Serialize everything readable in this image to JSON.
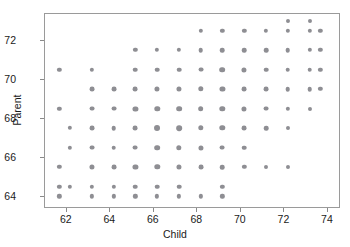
{
  "chart_data": {
    "type": "scatter",
    "title": "",
    "xlabel": "Child",
    "ylabel": "Parent",
    "xlim": [
      61.0,
      74.6
    ],
    "ylim": [
      63.4,
      73.4
    ],
    "grid": false,
    "legend": "none",
    "xticks": [
      62,
      64,
      66,
      68,
      70,
      72,
      74
    ],
    "yticks": [
      64,
      66,
      68,
      70,
      72
    ],
    "xtick_labels": [
      "62",
      "64",
      "66",
      "68",
      "70",
      "72",
      "74"
    ],
    "ytick_labels": [
      "64",
      "66",
      "68",
      "70",
      "72"
    ],
    "marker_color": "#8e8e93",
    "frame_color": "#9a9a9a",
    "points": [
      {
        "x": 61.7,
        "y": 70.5,
        "size": 3.2
      },
      {
        "x": 61.7,
        "y": 68.5,
        "size": 3.2
      },
      {
        "x": 61.7,
        "y": 65.5,
        "size": 3.2
      },
      {
        "x": 61.7,
        "y": 64.5,
        "size": 3.2
      },
      {
        "x": 61.7,
        "y": 64.0,
        "size": 3.2
      },
      {
        "x": 62.2,
        "y": 67.5,
        "size": 3.2
      },
      {
        "x": 62.2,
        "y": 66.5,
        "size": 3.2
      },
      {
        "x": 62.2,
        "y": 64.5,
        "size": 3.2
      },
      {
        "x": 63.2,
        "y": 70.5,
        "size": 3.2
      },
      {
        "x": 63.2,
        "y": 69.5,
        "size": 3.6
      },
      {
        "x": 63.2,
        "y": 68.5,
        "size": 3.6
      },
      {
        "x": 63.2,
        "y": 67.5,
        "size": 3.6
      },
      {
        "x": 63.2,
        "y": 66.5,
        "size": 3.6
      },
      {
        "x": 63.2,
        "y": 65.5,
        "size": 3.8
      },
      {
        "x": 63.2,
        "y": 64.5,
        "size": 3.2
      },
      {
        "x": 63.2,
        "y": 64.0,
        "size": 3.2
      },
      {
        "x": 64.2,
        "y": 69.5,
        "size": 3.6
      },
      {
        "x": 64.2,
        "y": 68.5,
        "size": 3.6
      },
      {
        "x": 64.2,
        "y": 67.5,
        "size": 3.4
      },
      {
        "x": 64.2,
        "y": 66.5,
        "size": 3.4
      },
      {
        "x": 64.2,
        "y": 65.5,
        "size": 3.6
      },
      {
        "x": 64.2,
        "y": 64.5,
        "size": 3.2
      },
      {
        "x": 64.2,
        "y": 64.0,
        "size": 3.2
      },
      {
        "x": 65.2,
        "y": 71.5,
        "size": 3.2
      },
      {
        "x": 65.2,
        "y": 70.5,
        "size": 3.4
      },
      {
        "x": 65.2,
        "y": 69.5,
        "size": 3.6
      },
      {
        "x": 65.2,
        "y": 68.5,
        "size": 3.8
      },
      {
        "x": 65.2,
        "y": 67.5,
        "size": 3.6
      },
      {
        "x": 65.2,
        "y": 66.5,
        "size": 3.6
      },
      {
        "x": 65.2,
        "y": 65.5,
        "size": 3.8
      },
      {
        "x": 65.2,
        "y": 64.5,
        "size": 3.4
      },
      {
        "x": 65.2,
        "y": 64.0,
        "size": 3.2
      },
      {
        "x": 66.2,
        "y": 71.5,
        "size": 3.2
      },
      {
        "x": 66.2,
        "y": 70.5,
        "size": 3.4
      },
      {
        "x": 66.2,
        "y": 69.5,
        "size": 3.8
      },
      {
        "x": 66.2,
        "y": 68.5,
        "size": 4.0
      },
      {
        "x": 66.2,
        "y": 67.5,
        "size": 4.4
      },
      {
        "x": 66.2,
        "y": 66.5,
        "size": 4.2
      },
      {
        "x": 66.2,
        "y": 65.5,
        "size": 4.0
      },
      {
        "x": 66.2,
        "y": 64.5,
        "size": 3.4
      },
      {
        "x": 66.2,
        "y": 64.0,
        "size": 3.2
      },
      {
        "x": 67.2,
        "y": 71.5,
        "size": 3.2
      },
      {
        "x": 67.2,
        "y": 70.5,
        "size": 3.4
      },
      {
        "x": 67.2,
        "y": 69.5,
        "size": 3.8
      },
      {
        "x": 67.2,
        "y": 68.5,
        "size": 4.2
      },
      {
        "x": 67.2,
        "y": 67.5,
        "size": 4.2
      },
      {
        "x": 67.2,
        "y": 66.5,
        "size": 4.0
      },
      {
        "x": 67.2,
        "y": 65.5,
        "size": 3.8
      },
      {
        "x": 67.2,
        "y": 64.5,
        "size": 3.4
      },
      {
        "x": 67.2,
        "y": 64.0,
        "size": 3.2
      },
      {
        "x": 68.2,
        "y": 72.5,
        "size": 3.2
      },
      {
        "x": 68.2,
        "y": 71.5,
        "size": 3.4
      },
      {
        "x": 68.2,
        "y": 70.5,
        "size": 3.6
      },
      {
        "x": 68.2,
        "y": 69.5,
        "size": 4.0
      },
      {
        "x": 68.2,
        "y": 68.5,
        "size": 4.2
      },
      {
        "x": 68.2,
        "y": 67.5,
        "size": 4.0
      },
      {
        "x": 68.2,
        "y": 66.5,
        "size": 3.8
      },
      {
        "x": 68.2,
        "y": 65.5,
        "size": 3.6
      },
      {
        "x": 68.2,
        "y": 64.0,
        "size": 3.2
      },
      {
        "x": 69.2,
        "y": 72.5,
        "size": 3.2
      },
      {
        "x": 69.2,
        "y": 71.5,
        "size": 3.4
      },
      {
        "x": 69.2,
        "y": 70.5,
        "size": 4.2
      },
      {
        "x": 69.2,
        "y": 69.5,
        "size": 3.8
      },
      {
        "x": 69.2,
        "y": 68.5,
        "size": 4.0
      },
      {
        "x": 69.2,
        "y": 67.5,
        "size": 4.0
      },
      {
        "x": 69.2,
        "y": 66.5,
        "size": 3.6
      },
      {
        "x": 69.2,
        "y": 65.5,
        "size": 3.4
      },
      {
        "x": 69.2,
        "y": 64.5,
        "size": 3.2
      },
      {
        "x": 69.2,
        "y": 64.0,
        "size": 3.2
      },
      {
        "x": 70.2,
        "y": 72.5,
        "size": 3.2
      },
      {
        "x": 70.2,
        "y": 71.5,
        "size": 3.4
      },
      {
        "x": 70.2,
        "y": 70.5,
        "size": 3.8
      },
      {
        "x": 70.2,
        "y": 69.5,
        "size": 3.6
      },
      {
        "x": 70.2,
        "y": 68.5,
        "size": 3.8
      },
      {
        "x": 70.2,
        "y": 67.5,
        "size": 3.6
      },
      {
        "x": 70.2,
        "y": 66.5,
        "size": 3.4
      },
      {
        "x": 70.2,
        "y": 65.5,
        "size": 3.2
      },
      {
        "x": 71.2,
        "y": 72.5,
        "size": 3.2
      },
      {
        "x": 71.2,
        "y": 71.5,
        "size": 3.4
      },
      {
        "x": 71.2,
        "y": 70.5,
        "size": 3.4
      },
      {
        "x": 71.2,
        "y": 69.5,
        "size": 3.6
      },
      {
        "x": 71.2,
        "y": 68.5,
        "size": 3.6
      },
      {
        "x": 71.2,
        "y": 67.5,
        "size": 3.4
      },
      {
        "x": 71.2,
        "y": 65.5,
        "size": 3.0
      },
      {
        "x": 72.2,
        "y": 73.0,
        "size": 3.0
      },
      {
        "x": 72.2,
        "y": 72.5,
        "size": 3.2
      },
      {
        "x": 72.2,
        "y": 71.5,
        "size": 3.4
      },
      {
        "x": 72.2,
        "y": 70.5,
        "size": 3.4
      },
      {
        "x": 72.2,
        "y": 69.5,
        "size": 3.4
      },
      {
        "x": 72.2,
        "y": 68.5,
        "size": 3.2
      },
      {
        "x": 72.2,
        "y": 67.5,
        "size": 3.0
      },
      {
        "x": 72.2,
        "y": 65.5,
        "size": 3.0
      },
      {
        "x": 73.2,
        "y": 73.0,
        "size": 3.0
      },
      {
        "x": 73.2,
        "y": 72.5,
        "size": 3.2
      },
      {
        "x": 73.2,
        "y": 71.5,
        "size": 3.2
      },
      {
        "x": 73.2,
        "y": 70.5,
        "size": 3.4
      },
      {
        "x": 73.2,
        "y": 69.5,
        "size": 3.4
      },
      {
        "x": 73.2,
        "y": 68.5,
        "size": 3.0
      },
      {
        "x": 73.7,
        "y": 72.5,
        "size": 3.2
      },
      {
        "x": 73.7,
        "y": 71.5,
        "size": 3.2
      },
      {
        "x": 73.7,
        "y": 70.5,
        "size": 3.2
      },
      {
        "x": 73.7,
        "y": 69.5,
        "size": 3.2
      }
    ]
  }
}
